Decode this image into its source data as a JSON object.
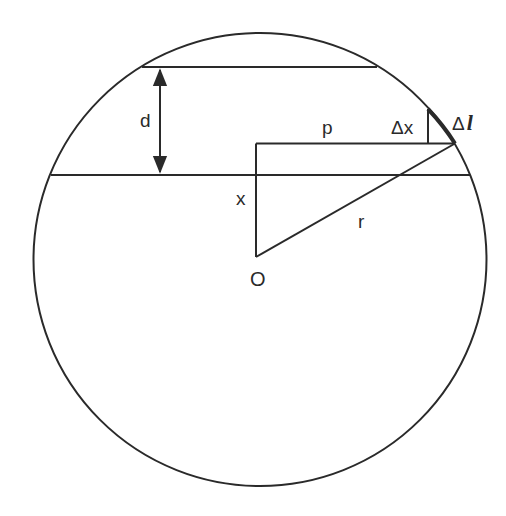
{
  "diagram": {
    "type": "geometry",
    "colors": {
      "stroke": "#2a2a2a",
      "background": "#ffffff"
    },
    "labels": {
      "d": "d",
      "p": "p",
      "delta_x": "Δx",
      "delta_l_symbol": "Δ",
      "delta_l_var": "l",
      "x": "x",
      "r": "r",
      "origin": "O"
    }
  }
}
